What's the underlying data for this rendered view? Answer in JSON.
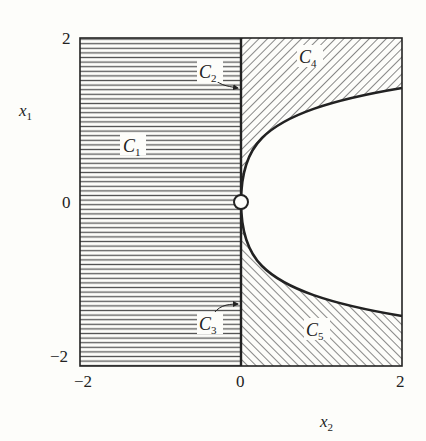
{
  "figure": {
    "axes": {
      "x": {
        "label": "x",
        "label_sub": "2",
        "ticks": [
          "−2",
          "0",
          "2"
        ],
        "range": [
          -2,
          2
        ]
      },
      "y": {
        "label": "x",
        "label_sub": "1",
        "ticks": [
          "2",
          "0",
          "−2"
        ],
        "range": [
          -2,
          2
        ]
      }
    },
    "regions": [
      {
        "id": "C1",
        "label": "C",
        "sub": "1",
        "fill": "horizontal-hatch",
        "description": "x2 < 0"
      },
      {
        "id": "C2",
        "label": "C",
        "sub": "2",
        "fill": "none",
        "description": "x2 = 0, x1 > 0 (boundary line, arrow)"
      },
      {
        "id": "C3",
        "label": "C",
        "sub": "3",
        "fill": "none",
        "description": "x2 = 0, x1 < 0 (boundary line, arrow)"
      },
      {
        "id": "C4",
        "label": "C",
        "sub": "4",
        "fill": "diagonal-hatch-backslash",
        "description": "x2 > 0, x1 > sqrt(x2)"
      },
      {
        "id": "C5",
        "label": "C",
        "sub": "5",
        "fill": "diagonal-hatch-slash",
        "description": "x2 > 0, x1 < -sqrt(x2)"
      }
    ],
    "boundary_curve": "x1 = ±sqrt(x2)",
    "origin_marker": "open-circle",
    "colors": {
      "line": "#222222",
      "hatch": "#555555",
      "background": "#fdfdfa"
    }
  }
}
